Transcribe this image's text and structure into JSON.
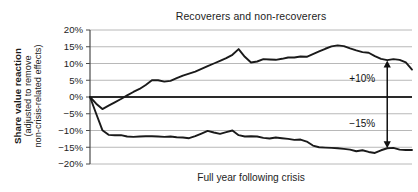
{
  "chart_data": {
    "type": "line",
    "title": "Recoverers and non-recoverers",
    "xlabel": "Full year following crisis",
    "ylabel_line1": "Share value reaction",
    "ylabel_line2": "(adjusted to remove",
    "ylabel_line3": "non-crisis-related effects)",
    "ylabel_full": "Share value reaction (adjusted to remove non-crisis-related effects)",
    "ylim": [
      -20,
      20
    ],
    "yticks": [
      20,
      15,
      10,
      5,
      0,
      -5,
      -10,
      -15,
      -20
    ],
    "ytick_labels": [
      "20%",
      "15%",
      "10%",
      "5%",
      "0%",
      "−5%",
      "−10%",
      "−15%",
      "−20%"
    ],
    "grid": true,
    "legend": "none",
    "xlim": [
      0,
      52
    ],
    "xticks": [],
    "xtick_labels": [],
    "zero_line": 0,
    "series": [
      {
        "name": "Recoverers",
        "color": "#1a1a1a",
        "x": [
          0,
          1,
          2,
          3,
          4,
          5,
          6,
          7,
          8,
          9,
          10,
          11,
          12,
          13,
          14,
          15,
          16,
          17,
          18,
          19,
          20,
          21,
          22,
          23,
          24,
          25,
          26,
          27,
          28,
          29,
          30,
          31,
          32,
          33,
          34,
          35,
          36,
          37,
          38,
          39,
          40,
          41,
          42,
          43,
          44,
          45,
          46,
          47,
          48,
          49,
          50,
          51,
          52
        ],
        "values": [
          0.0,
          -2.0,
          -3.6,
          -2.6,
          -1.6,
          -0.6,
          0.5,
          1.5,
          2.4,
          3.6,
          5.0,
          5.0,
          4.6,
          4.8,
          5.6,
          6.4,
          7.0,
          7.6,
          8.4,
          9.2,
          10.0,
          10.8,
          11.6,
          12.6,
          14.3,
          12.0,
          10.3,
          10.6,
          11.3,
          11.2,
          11.1,
          11.4,
          11.8,
          11.8,
          12.1,
          12.0,
          12.8,
          13.6,
          14.4,
          15.1,
          15.4,
          15.2,
          14.5,
          13.9,
          13.4,
          13.2,
          12.2,
          11.4,
          11.0,
          11.3,
          11.1,
          10.3,
          8.2
        ]
      },
      {
        "name": "Non-recoverers",
        "color": "#1a1a1a",
        "x": [
          0,
          1,
          2,
          3,
          4,
          5,
          6,
          7,
          8,
          9,
          10,
          11,
          12,
          13,
          14,
          15,
          16,
          17,
          18,
          19,
          20,
          21,
          22,
          23,
          24,
          25,
          26,
          27,
          28,
          29,
          30,
          31,
          32,
          33,
          34,
          35,
          36,
          37,
          38,
          39,
          40,
          41,
          42,
          43,
          44,
          45,
          46,
          47,
          48,
          49,
          50,
          51,
          52
        ],
        "values": [
          0.0,
          -5.0,
          -9.9,
          -11.3,
          -11.4,
          -11.4,
          -11.8,
          -11.9,
          -11.8,
          -11.7,
          -11.7,
          -11.8,
          -11.9,
          -11.8,
          -12.0,
          -12.1,
          -12.3,
          -11.7,
          -10.9,
          -10.1,
          -10.6,
          -11.0,
          -10.5,
          -10.0,
          -11.4,
          -11.8,
          -11.7,
          -11.8,
          -12.2,
          -12.4,
          -12.1,
          -12.3,
          -12.5,
          -12.8,
          -12.7,
          -13.3,
          -14.5,
          -15.0,
          -15.1,
          -15.2,
          -15.3,
          -15.5,
          -15.7,
          -16.2,
          -15.9,
          -16.4,
          -16.7,
          -15.9,
          -15.3,
          -15.2,
          -15.7,
          -15.8,
          -15.8
        ]
      }
    ],
    "annotations": [
      {
        "label": "+10%",
        "value": 10,
        "position": "above-zero"
      },
      {
        "label": "−15%",
        "value": -15,
        "position": "below-zero"
      }
    ],
    "arrow": {
      "name": "span-arrow",
      "x_value": 48,
      "top_value": 10.9,
      "bottom_value": -15.3,
      "double_headed": true
    },
    "colors": {
      "line": "#1a1a1a",
      "grid": "#b8b8b8",
      "axis": "#4a4a4a",
      "zero_line": "#2a2a2a",
      "text": "#1d1d1d",
      "background": "#ffffff"
    }
  }
}
